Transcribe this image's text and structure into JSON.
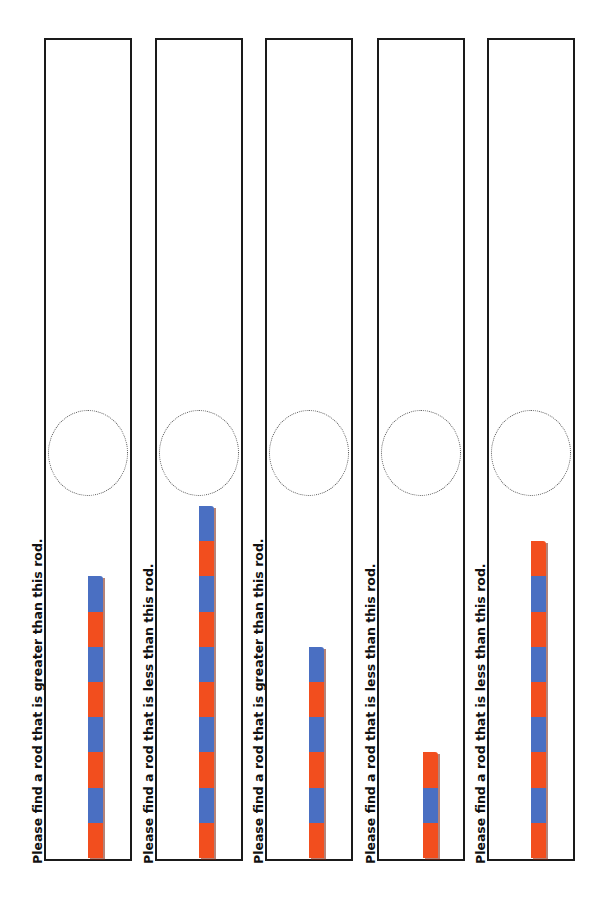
{
  "colors": {
    "red": "#f24e1e",
    "blue": "#4a6fc2",
    "border": "#1a1a1a"
  },
  "cards": [
    {
      "left": 44,
      "text_left": 30,
      "rod_left": 88,
      "label": "Please find a rod that is greater than this rod.",
      "rod_length": 8,
      "top_color": "blue"
    },
    {
      "left": 155,
      "text_left": 141,
      "rod_left": 199,
      "label": "Please find a rod that is less than this rod.",
      "rod_length": 10,
      "top_color": "blue"
    },
    {
      "left": 265,
      "text_left": 251,
      "rod_left": 309,
      "label": "Please find a rod that is greater than this rod.",
      "rod_length": 6,
      "top_color": "blue"
    },
    {
      "left": 377,
      "text_left": 363,
      "rod_left": 423,
      "label": "Please find a rod that is less than this rod.",
      "rod_length": 3,
      "top_color": "red"
    },
    {
      "left": 487,
      "text_left": 473,
      "rod_left": 531,
      "label": "Please find a rod that is less than this rod.",
      "rod_length": 9,
      "top_color": "red"
    }
  ]
}
